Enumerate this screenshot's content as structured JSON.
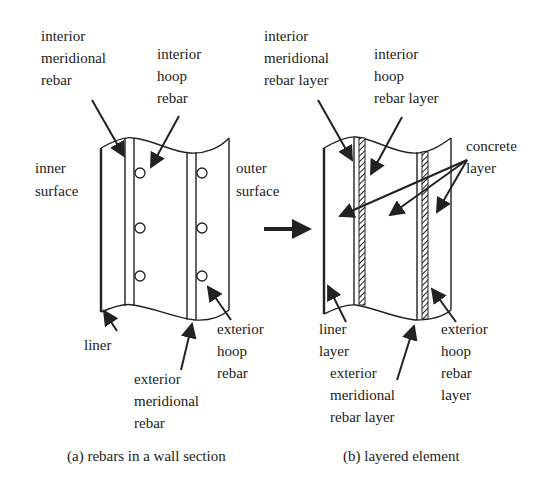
{
  "panel_a": {
    "caption": "(a) rebars in a wall section",
    "labels": {
      "interior_meridional": [
        "interior",
        "meridional",
        "rebar"
      ],
      "interior_hoop": [
        "interior",
        "hoop",
        "rebar"
      ],
      "inner_surface": [
        "inner",
        "surface"
      ],
      "outer_surface": [
        "outer",
        "surface"
      ],
      "liner": [
        "liner"
      ],
      "exterior_meridional": [
        "exterior",
        "meridional",
        "rebar"
      ],
      "exterior_hoop": [
        "exterior",
        "hoop",
        "rebar"
      ]
    }
  },
  "panel_b": {
    "caption": "(b) layered element",
    "labels": {
      "interior_meridional": [
        "interior",
        "meridional",
        "rebar layer"
      ],
      "interior_hoop": [
        "interior",
        "hoop",
        "rebar layer"
      ],
      "concrete": [
        "concrete",
        "layer"
      ],
      "liner": [
        "liner",
        "layer"
      ],
      "exterior_meridional": [
        "exterior",
        "meridional",
        "rebar layer"
      ],
      "exterior_hoop": [
        "exterior",
        "hoop",
        "rebar",
        "layer"
      ]
    }
  },
  "transition_arrow": "right-arrow"
}
